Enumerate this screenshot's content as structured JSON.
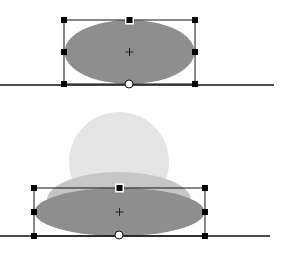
{
  "colors": {
    "background": "#ffffff",
    "ellipse_fill": "#8e8e8e",
    "ghost_circle_fill": "#e4e4e4",
    "ghost_ellipse_fill": "#c6c6c6",
    "line": "#111111",
    "handle": "#000000",
    "pivot_fill": "#ffffff"
  },
  "panels": [
    {
      "name": "before",
      "ground_line": {
        "x1": 0,
        "x2": 274,
        "y": 85
      },
      "ellipse": {
        "cx": 129.5,
        "cy": 52,
        "rx": 65,
        "ry": 32
      },
      "bbox": {
        "x": 64,
        "y": 20,
        "w": 131,
        "h": 64
      },
      "pivot": {
        "cx": 129,
        "cy": 84
      }
    },
    {
      "name": "after",
      "ghost_circle": {
        "cx": 119,
        "cy": 162,
        "r": 50
      },
      "ghost_ellipse": {
        "cx": 119,
        "cy": 200,
        "rx": 72,
        "ry": 28
      },
      "ground_line": {
        "x1": 0,
        "x2": 270,
        "y": 236
      },
      "ellipse": {
        "cx": 119.5,
        "cy": 212,
        "rx": 85,
        "ry": 24
      },
      "bbox": {
        "x": 34,
        "y": 188,
        "w": 171,
        "h": 48
      },
      "pivot": {
        "cx": 119,
        "cy": 235
      }
    }
  ]
}
